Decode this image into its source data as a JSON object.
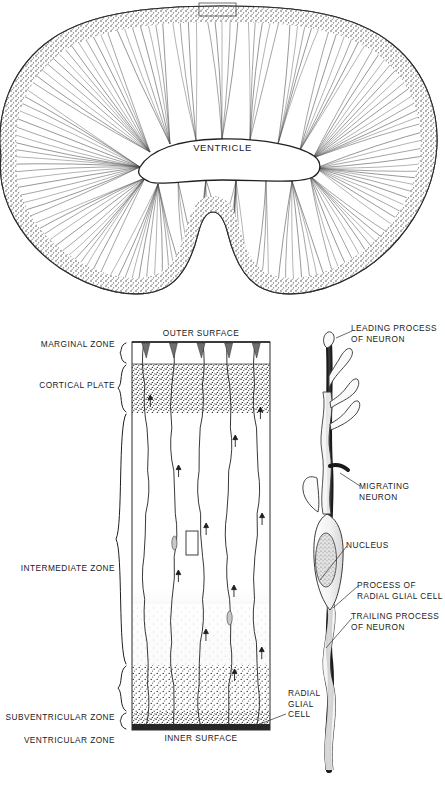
{
  "figure": {
    "type": "scientific-diagram"
  },
  "top_panel": {
    "name": "cerebral-hemisphere-cross-section",
    "ventricle_label": "VENTRICLE",
    "inset_marker": "magnified-region-rectangle",
    "description": "Cross section of developing cerebral hemisphere showing radial glial fibers fanning from ventricle to outer surface"
  },
  "column_panel": {
    "top_surface_label": "OUTER SURFACE",
    "bottom_surface_label": "INNER SURFACE",
    "zones": [
      {
        "label": "MARGINAL ZONE",
        "brace": true
      },
      {
        "label": "CORTICAL PLATE",
        "brace": true
      },
      {
        "label": "INTERMEDIATE ZONE",
        "brace": true
      },
      {
        "label": "SUBVENTRICULAR ZONE",
        "brace": true
      },
      {
        "label": "VENTRICULAR ZONE",
        "brace": true
      }
    ],
    "callout_label": "RADIAL\nGLIAL\nCELL",
    "inset_marker": "magnified-neuron-rectangle",
    "fiber_count": 5,
    "arrow_meaning": "direction of neuronal migration"
  },
  "neuron_panel": {
    "name": "migrating-neuron-detail",
    "labels": [
      {
        "id": "leading-process",
        "text": "LEADING PROCESS\nOF NEURON"
      },
      {
        "id": "migrating-neuron",
        "text": "MIGRATING NEURON"
      },
      {
        "id": "nucleus",
        "text": "NUCLEUS"
      },
      {
        "id": "glial-process",
        "text": "PROCESS OF\nRADIAL GLIAL CELL"
      },
      {
        "id": "trailing-process",
        "text": "TRAILING PROCESS\nOF  NEURON"
      }
    ]
  },
  "colors": {
    "ink": "#1a1a1a",
    "line": "#2b2b2b",
    "stipple_dark": "#3a3a3a",
    "stipple_light": "#9a9a9a",
    "fill_white": "#ffffff",
    "glial_fiber_dark": "#1e1e1e",
    "neuron_body": "#efefef"
  }
}
